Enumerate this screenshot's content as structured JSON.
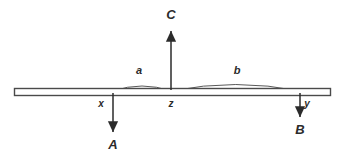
{
  "figure": {
    "type": "free-body-diagram",
    "background_color": "#ffffff",
    "line_color": "#2b2b2b",
    "beam_fill_color": "#ffffff",
    "arc_color": "#555555"
  },
  "beam": {
    "name": "rigid-bar",
    "x_start": 14,
    "x_end": 331,
    "y_top": 88,
    "y_bottom": 96
  },
  "forces": [
    {
      "label": "A",
      "direction": "down",
      "point": "x",
      "x": 113,
      "y_start": 96,
      "y_end": 134,
      "label_x": 113,
      "label_y": 149
    },
    {
      "label": "B",
      "direction": "down",
      "point": "y",
      "x": 300,
      "y_start": 96,
      "y_end": 119,
      "label_x": 300,
      "label_y": 134
    },
    {
      "label": "C",
      "direction": "up",
      "point": "z",
      "x": 171,
      "y_start": 90,
      "y_end": 29,
      "label_x": 171,
      "label_y": 19
    }
  ],
  "points": [
    {
      "label": "x",
      "x": 101,
      "y": 107
    },
    {
      "label": "z",
      "x": 171,
      "y": 107
    },
    {
      "label": "y",
      "x": 307,
      "y": 107
    }
  ],
  "spans": [
    {
      "label": "a",
      "from_point": "x",
      "to_point": "z",
      "x_start": 113,
      "x_end": 171,
      "peak_y": 83,
      "label_x": 139,
      "label_y": 74
    },
    {
      "label": "b",
      "from_point": "z",
      "to_point": "y",
      "x_start": 171,
      "x_end": 300,
      "peak_y": 81,
      "label_x": 237,
      "label_y": 74
    }
  ]
}
